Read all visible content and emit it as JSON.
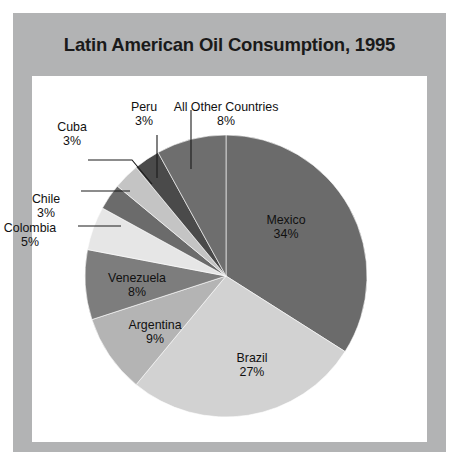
{
  "figure": {
    "title": "Latin American Oil Consumption, 1995",
    "frame_color": "#b2b3b4",
    "panel_color": "#ffffff",
    "title_color": "#1a1a1a"
  },
  "chart_data": {
    "type": "pie",
    "title": "Latin American Oil Consumption, 1995",
    "xlabel": "",
    "ylabel": "",
    "units": "percent of total",
    "legend": "none (direct labels with leader lines)",
    "grid": false,
    "start_angle_deg": 0,
    "direction": "clockwise",
    "total": 100,
    "categories": [
      "Mexico",
      "Brazil",
      "Argentina",
      "Venezuela",
      "Colombia",
      "Chile",
      "Cuba",
      "Peru",
      "All Other Countries"
    ],
    "values": [
      34,
      27,
      9,
      8,
      5,
      3,
      3,
      3,
      8
    ],
    "slices": [
      {
        "name": "Mexico",
        "label": "Mexico",
        "pct_text": "34%",
        "value": 34,
        "color": "#6b6b6b",
        "label_placement": "inside",
        "label_x": 286,
        "label_y": 213
      },
      {
        "name": "Brazil",
        "label": "Brazil",
        "pct_text": "27%",
        "value": 27,
        "color": "#d2d2d2",
        "label_placement": "inside",
        "label_x": 252,
        "label_y": 351
      },
      {
        "name": "Argentina",
        "label": "Argentina",
        "pct_text": "9%",
        "value": 9,
        "color": "#b4b4b4",
        "label_placement": "inside",
        "label_x": 155,
        "label_y": 318
      },
      {
        "name": "Venezuela",
        "label": "Venezuela",
        "pct_text": "8%",
        "value": 8,
        "color": "#7d7d7d",
        "label_placement": "inside",
        "label_x": 137,
        "label_y": 271
      },
      {
        "name": "Colombia",
        "label": "Colombia",
        "pct_text": "5%",
        "value": 5,
        "color": "#e6e6e6",
        "label_placement": "outside",
        "label_x": 30,
        "label_y": 221
      },
      {
        "name": "Chile",
        "label": "Chile",
        "pct_text": "3%",
        "value": 3,
        "color": "#6b6b6b",
        "label_placement": "outside",
        "label_x": 46,
        "label_y": 192
      },
      {
        "name": "Cuba",
        "label": "Cuba",
        "pct_text": "3%",
        "value": 3,
        "color": "#c4c4c4",
        "label_placement": "outside",
        "label_x": 72,
        "label_y": 120
      },
      {
        "name": "Peru",
        "label": "Peru",
        "pct_text": "3%",
        "value": 3,
        "color": "#4a4a4a",
        "label_placement": "outside",
        "label_x": 144,
        "label_y": 100
      },
      {
        "name": "All Other Countries",
        "label": "All Other Countries",
        "pct_text": "8%",
        "value": 8,
        "color": "#6e6e6e",
        "label_placement": "outside",
        "label_x": 226,
        "label_y": 100
      }
    ],
    "geometry": {
      "cx": 226,
      "cy": 276,
      "r": 141
    },
    "leaders": [
      {
        "for": "All Other Countries",
        "points": "191,110 191,169"
      },
      {
        "for": "Peru",
        "points": "157,135 157,178"
      },
      {
        "for": "Cuba",
        "points": "88,160 132,160 152,184"
      },
      {
        "for": "Chile",
        "points": "81,191 130,191"
      },
      {
        "for": "Colombia",
        "points": "78,226 121,226"
      }
    ]
  }
}
